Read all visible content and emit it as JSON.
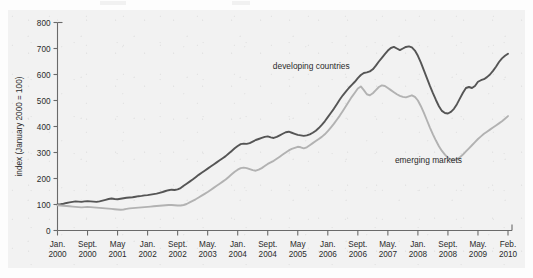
{
  "chart_data": {
    "type": "line",
    "title": "",
    "xlabel": "",
    "ylabel": "index (January 2000 = 100)",
    "ylim": [
      0,
      800
    ],
    "ytick_step": 100,
    "yticks": [
      0,
      100,
      200,
      300,
      400,
      500,
      600,
      700,
      800
    ],
    "grid": false,
    "legend_position": "inline-annotation",
    "xticks": [
      {
        "month": "Jan.",
        "year": "2000"
      },
      {
        "month": "Sept.",
        "year": "2000"
      },
      {
        "month": "May",
        "year": "2001"
      },
      {
        "month": "Jan.",
        "year": "2002"
      },
      {
        "month": "Sept.",
        "year": "2002"
      },
      {
        "month": "May.",
        "year": "2003"
      },
      {
        "month": "Jan.",
        "year": "2004"
      },
      {
        "month": "Sept.",
        "year": "2004"
      },
      {
        "month": "May",
        "year": "2005"
      },
      {
        "month": "Jan.",
        "year": "2006"
      },
      {
        "month": "Sept.",
        "year": "2006"
      },
      {
        "month": "May.",
        "year": "2007"
      },
      {
        "month": "Jan.",
        "year": "2008"
      },
      {
        "month": "Sept.",
        "year": "2008"
      },
      {
        "month": "May.",
        "year": "2009"
      },
      {
        "month": "Feb.",
        "year": "2010"
      }
    ],
    "x_index_range": [
      0,
      15
    ],
    "series": [
      {
        "name": "developing countries",
        "color": "#555555",
        "label_x_index": 8.45,
        "label_y_value": 622,
        "values": [
          100,
          101,
          103,
          106,
          108,
          110,
          112,
          111,
          110,
          112,
          113,
          112,
          111,
          110,
          112,
          115,
          118,
          121,
          123,
          121,
          120,
          122,
          124,
          126,
          127,
          128,
          130,
          132,
          133,
          135,
          136,
          138,
          140,
          142,
          145,
          148,
          152,
          155,
          157,
          156,
          158,
          163,
          172,
          180,
          188,
          196,
          205,
          214,
          222,
          230,
          238,
          246,
          254,
          262,
          270,
          278,
          286,
          296,
          306,
          316,
          325,
          332,
          334,
          333,
          336,
          342,
          348,
          352,
          356,
          360,
          362,
          358,
          356,
          360,
          366,
          372,
          378,
          380,
          376,
          372,
          368,
          366,
          364,
          366,
          370,
          376,
          384,
          394,
          406,
          420,
          436,
          452,
          468,
          486,
          504,
          520,
          534,
          548,
          560,
          572,
          586,
          598,
          606,
          608,
          612,
          620,
          634,
          650,
          664,
          678,
          692,
          702,
          706,
          700,
          694,
          700,
          706,
          708,
          704,
          692,
          672,
          646,
          616,
          586,
          556,
          528,
          502,
          478,
          460,
          452,
          450,
          456,
          468,
          486,
          508,
          530,
          548,
          552,
          548,
          556,
          572,
          578,
          582,
          590,
          600,
          614,
          630,
          648,
          662,
          672,
          680
        ]
      },
      {
        "name": "emerging markets",
        "color": "#b2b2b2",
        "label_x_index": 12.35,
        "label_y_value": 258,
        "values": [
          97,
          96,
          95,
          94,
          93,
          92,
          91,
          90,
          89,
          90,
          91,
          90,
          89,
          88,
          87,
          86,
          85,
          84,
          83,
          82,
          81,
          80,
          81,
          83,
          85,
          86,
          87,
          88,
          89,
          90,
          91,
          92,
          93,
          94,
          95,
          96,
          97,
          98,
          98,
          97,
          96,
          96,
          98,
          102,
          108,
          114,
          120,
          127,
          134,
          141,
          148,
          156,
          164,
          172,
          180,
          188,
          196,
          206,
          216,
          226,
          234,
          240,
          242,
          240,
          236,
          232,
          230,
          234,
          240,
          248,
          256,
          262,
          268,
          276,
          284,
          292,
          300,
          308,
          314,
          318,
          322,
          320,
          316,
          320,
          328,
          336,
          344,
          352,
          360,
          370,
          382,
          396,
          410,
          426,
          442,
          460,
          478,
          496,
          514,
          530,
          546,
          554,
          540,
          524,
          520,
          528,
          540,
          552,
          558,
          556,
          548,
          540,
          532,
          524,
          518,
          514,
          512,
          516,
          520,
          514,
          500,
          478,
          452,
          424,
          396,
          370,
          346,
          324,
          306,
          292,
          280,
          272,
          270,
          274,
          282,
          292,
          304,
          316,
          328,
          340,
          352,
          362,
          372,
          380,
          388,
          396,
          404,
          412,
          420,
          430,
          440
        ]
      }
    ]
  }
}
